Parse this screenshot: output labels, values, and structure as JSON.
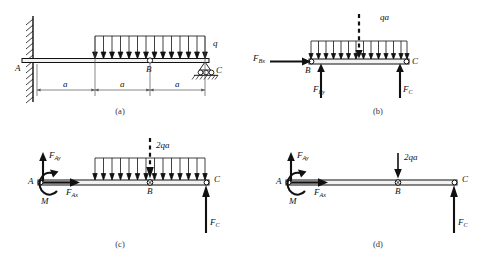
{
  "figure": {
    "stroke_color": "#111111",
    "beam_fill": "#f2f2f2",
    "dimension_color": "#555555"
  },
  "panels": [
    {
      "id": "a",
      "caption": "(a)",
      "labels": {
        "point_a": "A",
        "point_b": "B",
        "point_c": "C",
        "load": "q",
        "dim1": "a",
        "dim2": "a",
        "dim3": "a"
      },
      "supports": {
        "left": "fixed-wall-support",
        "middle": "internal-hinge",
        "right": "roller-support"
      }
    },
    {
      "id": "b",
      "caption": "(b)",
      "labels": {
        "point_b": "B",
        "point_c": "C",
        "resultant": "qa",
        "force_bx": "F",
        "force_bx_sub": "Bx",
        "force_by": "F",
        "force_by_sub": "By",
        "force_c": "F",
        "force_c_sub": "C"
      }
    },
    {
      "id": "c",
      "caption": "(c)",
      "labels": {
        "point_a": "A",
        "point_b": "B",
        "point_c": "C",
        "resultant": "2qa",
        "force_ay": "F",
        "force_ay_sub": "Ay",
        "force_ax": "F",
        "force_ax_sub": "Ax",
        "moment": "M",
        "force_c": "F",
        "force_c_sub": "C"
      }
    },
    {
      "id": "d",
      "caption": "(d)",
      "labels": {
        "point_a": "A",
        "point_b": "B",
        "point_c": "C",
        "resultant": "2qa",
        "force_ay": "F",
        "force_ay_sub": "Ay",
        "force_ax": "F",
        "force_ax_sub": "Ax",
        "moment": "M",
        "force_c": "F",
        "force_c_sub": "C"
      }
    }
  ]
}
